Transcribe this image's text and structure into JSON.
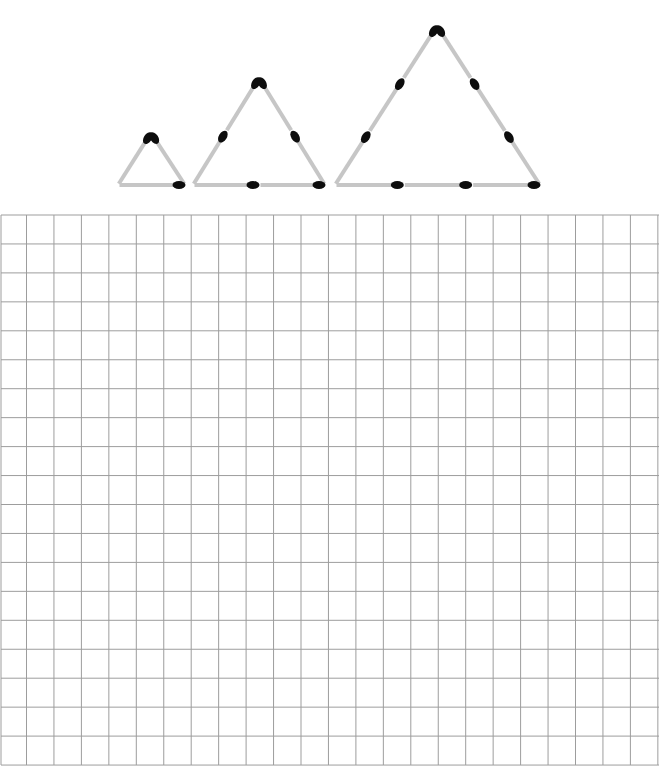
{
  "diagram": {
    "stick_color": "#c6c6c6",
    "head_color": "#0d0d0d",
    "grid_color": "#9d9d9d",
    "triangles": [
      {
        "name": "triangle-size-1",
        "side_matches": 1,
        "total_matches": 3,
        "apex": [
          151,
          133
        ],
        "base_left": [
          118,
          185
        ],
        "base_right": [
          185,
          185
        ]
      },
      {
        "name": "triangle-size-2",
        "side_matches": 2,
        "total_matches": 6,
        "apex": [
          259,
          78
        ],
        "base_left": [
          193,
          185
        ],
        "base_right": [
          325,
          185
        ]
      },
      {
        "name": "triangle-size-3",
        "side_matches": 3,
        "total_matches": 9,
        "apex": [
          437,
          26
        ],
        "base_left": [
          335,
          185
        ],
        "base_right": [
          540,
          185
        ]
      }
    ],
    "grid": {
      "left": 1,
      "top": 215,
      "right": 659,
      "bottom": 765,
      "first_col_x": 26.5,
      "col_step": 27.45,
      "columns": 24,
      "row_step": 28.95,
      "rows": 19
    }
  }
}
